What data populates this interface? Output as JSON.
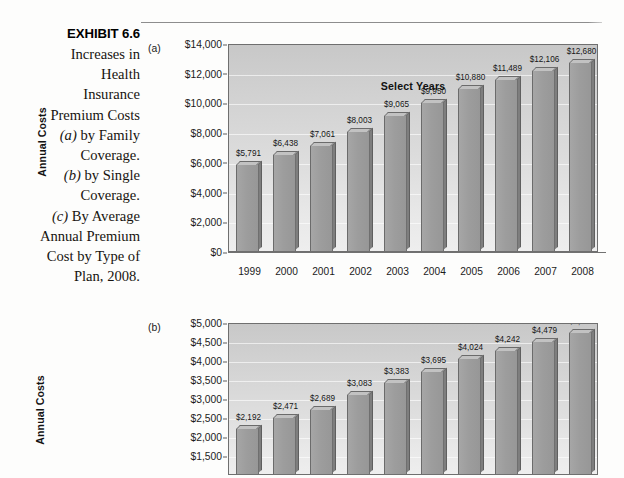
{
  "exhibit": {
    "number": "EXHIBIT 6.6",
    "lines": [
      {
        "text": "Increases in"
      },
      {
        "text": "Health"
      },
      {
        "text": "Insurance"
      },
      {
        "text": "Premium Costs"
      },
      {
        "italic": "(a)",
        "text": " by Family"
      },
      {
        "text": "Coverage."
      },
      {
        "italic": "(b)",
        "text": " by Single"
      },
      {
        "text": "Coverage."
      },
      {
        "italic": "(c)",
        "text": " By Average"
      },
      {
        "text": "Annual Premium"
      },
      {
        "text": "Cost by Type of"
      },
      {
        "text": "Plan, 2008."
      }
    ]
  },
  "chart_data": [
    {
      "id": "a",
      "panel_label": "(a)",
      "type": "bar",
      "title": "",
      "xlabel": "Select Years",
      "ylabel": "Annual Costs",
      "categories": [
        "1999",
        "2000",
        "2001",
        "2002",
        "2003",
        "2004",
        "2005",
        "2006",
        "2007",
        "2008"
      ],
      "values": [
        5791,
        6438,
        7061,
        8003,
        9065,
        9950,
        10880,
        11489,
        12106,
        12680
      ],
      "data_labels": [
        "$5,791",
        "$6,438",
        "$7,061",
        "$8,003",
        "$9,065",
        "$9,950",
        "$10,880",
        "$11,489",
        "$12,106",
        "$12,680"
      ],
      "ylim": [
        0,
        14000
      ],
      "ytick_values": [
        14000,
        12000,
        10000,
        8000,
        6000,
        4000,
        2000,
        0
      ],
      "ytick_labels": [
        "$14,000",
        "$12,000",
        "$10,000",
        "$8,000",
        "$6,000",
        "$4,000",
        "$2,000",
        "$0"
      ],
      "grid": true,
      "legend": "none",
      "bar_color": "#9d9d9d"
    },
    {
      "id": "b",
      "panel_label": "(b)",
      "type": "bar",
      "title": "",
      "xlabel": "",
      "ylabel": "Annual Costs",
      "categories": [
        "1999",
        "2000",
        "2001",
        "2002",
        "2003",
        "2004",
        "2005",
        "2006",
        "2007",
        "2008"
      ],
      "values": [
        2192,
        2471,
        2689,
        3083,
        3383,
        3695,
        4024,
        4242,
        4479,
        4704
      ],
      "data_labels": [
        "$2,192",
        "$2,471",
        "$2,689",
        "$3,083",
        "$3,383",
        "$3,695",
        "$4,024",
        "$4,242",
        "$4,479",
        "$4,704"
      ],
      "ylim": [
        1000,
        5000
      ],
      "ytick_values": [
        5000,
        4500,
        4000,
        3500,
        3000,
        2500,
        2000,
        1500
      ],
      "ytick_labels": [
        "$5,000",
        "$4,500",
        "$4,000",
        "$3,500",
        "$3,000",
        "$2,500",
        "$2,000",
        "$1,500"
      ],
      "grid": true,
      "legend": "none",
      "bar_color": "#9d9d9d",
      "clipped_at_bottom": true
    }
  ]
}
